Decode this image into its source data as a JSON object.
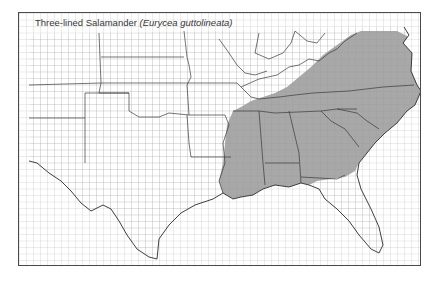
{
  "map": {
    "title_common": "Three-lined Salamander",
    "title_scientific": "Eurycea guttolineata",
    "region": "Southeastern and south-central United States (county-level map)",
    "legend": {
      "range_fill_color": "#a8a8a8",
      "non_range_fill_color": "#ffffff"
    },
    "range_states": [
      "Louisiana (east)",
      "Mississippi",
      "Alabama",
      "Georgia",
      "South Carolina",
      "North Carolina",
      "Tennessee (west & south)",
      "Kentucky (southwest)",
      "Virginia (east)",
      "Florida (panhandle)",
      "Maryland (south)"
    ],
    "colors": {
      "frame": "#4a4a4a",
      "state_lines": "#3a3a3a",
      "county_lines": "#9a9a9a",
      "range_fill": "#a8a8a8"
    }
  }
}
